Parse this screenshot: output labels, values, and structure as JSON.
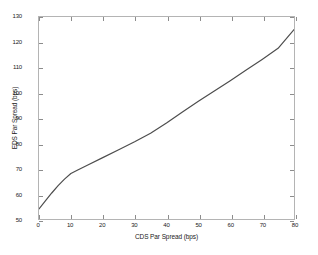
{
  "chart_data": {
    "type": "line",
    "title": "",
    "xlabel": "CDS Par Spread (bps)",
    "ylabel": "EDS Par Spread (bps)",
    "xlim": [
      0,
      80
    ],
    "ylim": [
      50,
      130
    ],
    "xticks": [
      0,
      10,
      20,
      30,
      40,
      50,
      60,
      70,
      80
    ],
    "yticks": [
      50,
      60,
      70,
      80,
      90,
      100,
      110,
      120,
      130
    ],
    "xtick_labels": [
      "0",
      "10",
      "20",
      "30",
      "40",
      "50",
      "60",
      "70",
      "80"
    ],
    "ytick_labels": [
      "50",
      "60",
      "70",
      "80",
      "90",
      "100",
      "110",
      "120",
      "130"
    ],
    "grid": false,
    "legend": null,
    "line_color": "#4d4d4d",
    "axis_color": "#b4b4b4",
    "background_color": "#ffffff",
    "series": [
      {
        "name": "EDS vs CDS Par Spread",
        "x": [
          0,
          2,
          4,
          6,
          8,
          10,
          12,
          15,
          20,
          25,
          30,
          35,
          40,
          45,
          50,
          55,
          60,
          65,
          70,
          75,
          80
        ],
        "y": [
          54.0,
          57.2,
          60.3,
          63.2,
          65.8,
          68.0,
          69.3,
          71.2,
          74.3,
          77.4,
          80.6,
          84.0,
          88.0,
          92.4,
          96.6,
          100.7,
          104.8,
          109.0,
          113.2,
          117.6,
          125.0
        ]
      }
    ]
  }
}
